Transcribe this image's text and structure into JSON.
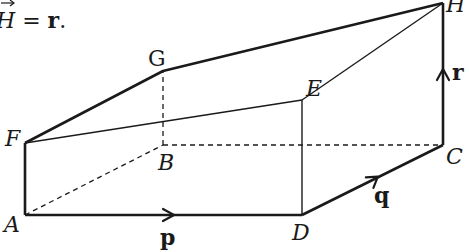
{
  "caption": {
    "prefix_italic": "H",
    "equals": " = ",
    "vector": "r",
    "suffix": "."
  },
  "vertices": {
    "A": {
      "label": "A",
      "x": 25,
      "y": 215
    },
    "D": {
      "label": "D",
      "x": 302,
      "y": 215
    },
    "C": {
      "label": "C",
      "x": 443,
      "y": 145
    },
    "H": {
      "label": "H",
      "x": 443,
      "y": 3
    },
    "F": {
      "label": "F",
      "x": 25,
      "y": 143
    },
    "E": {
      "label": "E",
      "x": 302,
      "y": 100
    },
    "G": {
      "label": "G",
      "x": 163,
      "y": 71
    },
    "B": {
      "label": "B",
      "x": 163,
      "y": 145
    }
  },
  "vectors": {
    "p": "p",
    "q": "q",
    "r": "r"
  },
  "colors": {
    "stroke": "#1a1a1a",
    "background": "#ffffff"
  }
}
